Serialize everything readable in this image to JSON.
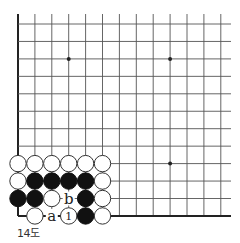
{
  "diagram": {
    "caption": "14도",
    "board": {
      "origin_x": 18,
      "origin_y": 24,
      "spacing_x": 16.9,
      "spacing_y": 17.45,
      "cols": 13,
      "rows": 12,
      "line_top": 14,
      "line_right": 231,
      "left_edge": true,
      "bottom_edge": true,
      "line_color": "#555555",
      "edge_color": "#222222",
      "stone_radius": 8.2
    },
    "star_points": [
      {
        "col": 3,
        "row": 2
      },
      {
        "col": 9,
        "row": 2
      },
      {
        "col": 9,
        "row": 8
      }
    ],
    "stones": [
      {
        "col": 0,
        "row": 8,
        "color": "white"
      },
      {
        "col": 1,
        "row": 8,
        "color": "white"
      },
      {
        "col": 2,
        "row": 8,
        "color": "white"
      },
      {
        "col": 3,
        "row": 8,
        "color": "white"
      },
      {
        "col": 4,
        "row": 8,
        "color": "white"
      },
      {
        "col": 5,
        "row": 8,
        "color": "white"
      },
      {
        "col": 0,
        "row": 9,
        "color": "white"
      },
      {
        "col": 1,
        "row": 9,
        "color": "black"
      },
      {
        "col": 2,
        "row": 9,
        "color": "black"
      },
      {
        "col": 3,
        "row": 9,
        "color": "black"
      },
      {
        "col": 4,
        "row": 9,
        "color": "black"
      },
      {
        "col": 5,
        "row": 9,
        "color": "white"
      },
      {
        "col": 0,
        "row": 10,
        "color": "black"
      },
      {
        "col": 1,
        "row": 10,
        "color": "black"
      },
      {
        "col": 2,
        "row": 10,
        "color": "white"
      },
      {
        "col": 4,
        "row": 10,
        "color": "black"
      },
      {
        "col": 5,
        "row": 10,
        "color": "white"
      },
      {
        "col": 1,
        "row": 11,
        "color": "white"
      },
      {
        "col": 3,
        "row": 11,
        "color": "white",
        "label": "1"
      },
      {
        "col": 4,
        "row": 11,
        "color": "black"
      },
      {
        "col": 5,
        "row": 11,
        "color": "white"
      }
    ],
    "markers": [
      {
        "col": 3,
        "row": 10,
        "label": "b"
      },
      {
        "col": 2,
        "row": 11,
        "label": "a"
      }
    ]
  }
}
